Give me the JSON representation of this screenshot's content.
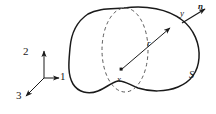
{
  "figure": {
    "domain": "continuum-mechanics-diagram",
    "background_color": "#ffffff",
    "stroke_color": "#1a1a1a",
    "dashed_stroke_color": "#555555",
    "labels": {
      "axis_1": "1",
      "axis_2": "2",
      "axis_3": "3",
      "point_x": "x",
      "point_y": "y",
      "radius": "r",
      "normal": "n",
      "surface": "S"
    },
    "icons": {
      "axis_triad": "coordinate-axes-icon",
      "body": "blob-body-icon",
      "sphere": "dashed-ellipse-icon",
      "radius_arrow": "radius-vector-arrow-icon",
      "normal_arrow": "normal-vector-arrow-icon",
      "center_dot": "point-marker-icon"
    },
    "geometry": {
      "triad_origin": [
        44,
        78
      ],
      "axis_1_tip": [
        58,
        78
      ],
      "axis_2_tip": [
        44,
        50
      ],
      "axis_3_tip": [
        26,
        96
      ],
      "point_x": [
        121,
        70
      ],
      "point_y": [
        172,
        26
      ],
      "normal_tip": [
        205,
        9
      ],
      "ellipse_center": [
        125,
        50
      ],
      "ellipse_rx": 23,
      "ellipse_ry": 42
    }
  }
}
